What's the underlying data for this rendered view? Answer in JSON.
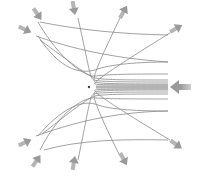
{
  "diagram": {
    "type": "particle-scattering-trajectories",
    "colors": {
      "background": "#ffffff",
      "trajectory": "#8a8a8a",
      "arrow": "#9a9a9a",
      "nucleus": "#444444"
    },
    "nucleus": {
      "x": 89,
      "y": 87
    },
    "incoming_arrow": {
      "x": 181,
      "y": 87,
      "direction": "left"
    },
    "incoming_lines_y": [
      62,
      74,
      80,
      82,
      84,
      85,
      86,
      87,
      88,
      89,
      90,
      92,
      94,
      99,
      111
    ],
    "outgoing_arrows": [
      {
        "name": "top-left-upper",
        "x": 38,
        "y": 15
      },
      {
        "name": "top-left-lower",
        "x": 26,
        "y": 30
      },
      {
        "name": "top-center-left",
        "x": 74,
        "y": 9
      },
      {
        "name": "top-center-right",
        "x": 124,
        "y": 11
      },
      {
        "name": "top-right",
        "x": 177,
        "y": 28
      },
      {
        "name": "bottom-left-upper",
        "x": 26,
        "y": 142
      },
      {
        "name": "bottom-left-lower",
        "x": 37,
        "y": 160
      },
      {
        "name": "bottom-center-left",
        "x": 74,
        "y": 162
      },
      {
        "name": "bottom-center-right",
        "x": 124,
        "y": 160
      },
      {
        "name": "bottom-right",
        "x": 177,
        "y": 145
      }
    ]
  }
}
